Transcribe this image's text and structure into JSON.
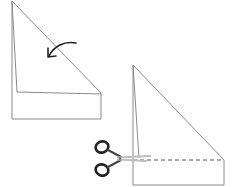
{
  "diagram": {
    "type": "paper-folding-instructions",
    "steps": [
      {
        "id": "step-1",
        "description": "Folded paper triangle with rectangular strip below; curved arrow indicates folding the corner down",
        "icon": "curved-fold-arrow-icon"
      },
      {
        "id": "step-2",
        "description": "Folded triangle with rectangular strip; dashed cut line along the fold with scissors",
        "icon": "scissors-icon"
      }
    ],
    "colors": {
      "line": "#7a7a7a",
      "dark": "#222222",
      "background": "#ffffff"
    }
  }
}
